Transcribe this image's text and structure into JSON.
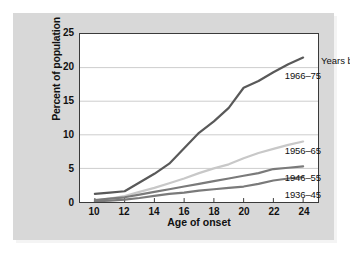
{
  "chart_data": {
    "type": "line",
    "title": "",
    "xlabel": "Age of onset",
    "ylabel": "Percent of population",
    "xlim": [
      9,
      25
    ],
    "ylim": [
      0,
      25
    ],
    "xticks": [
      10,
      12,
      14,
      16,
      18,
      20,
      22,
      24
    ],
    "yticks": [
      0,
      5,
      10,
      15,
      20,
      25
    ],
    "grid": "horizontal",
    "legend_position": "right-inline",
    "legend_title": "Years born:",
    "x": [
      10,
      11,
      12,
      13,
      14,
      15,
      16,
      17,
      18,
      19,
      20,
      21,
      22,
      23,
      24
    ],
    "series": [
      {
        "name": "1966-75",
        "label": "1966–75",
        "color": "#595959",
        "width": 2.2,
        "values": [
          1.2,
          1.4,
          1.6,
          2.9,
          4.2,
          5.7,
          8.0,
          10.3,
          12.0,
          14.0,
          17.0,
          18.0,
          19.3,
          20.5,
          21.5
        ],
        "label_x": 313,
        "label_y": 58
      },
      {
        "name": "1956-65",
        "label": "1956–65",
        "color": "#c8c8c8",
        "width": 2.2,
        "values": [
          0.2,
          0.5,
          0.9,
          1.5,
          2.1,
          2.8,
          3.5,
          4.3,
          5.0,
          5.6,
          6.5,
          7.3,
          7.9,
          8.5,
          9.0
        ],
        "label_x": 313,
        "label_y": 133
      },
      {
        "name": "1946-55",
        "label": "1946–55",
        "color": "#7a7a7a",
        "width": 2.2,
        "values": [
          0.3,
          0.5,
          0.7,
          1.1,
          1.5,
          1.9,
          2.3,
          2.7,
          3.1,
          3.5,
          3.9,
          4.3,
          4.9,
          5.1,
          5.3
        ],
        "label_x": 313,
        "label_y": 160
      },
      {
        "name": "1936-45",
        "label": "1936–45",
        "color": "#7a7a7a",
        "width": 2.2,
        "values": [
          0.1,
          0.2,
          0.35,
          0.6,
          0.9,
          1.2,
          1.4,
          1.7,
          1.9,
          2.1,
          2.3,
          2.7,
          3.2,
          3.5,
          3.7
        ],
        "label_x": 313,
        "label_y": 177
      }
    ],
    "legend_title_x": 313,
    "legend_title_y": 43,
    "colors": {
      "figure_background": "#d8d8d8",
      "plot_background": "#ffffff",
      "frame": "#3a3a3a",
      "gridline": "#cccccc",
      "text": "#111111"
    }
  }
}
